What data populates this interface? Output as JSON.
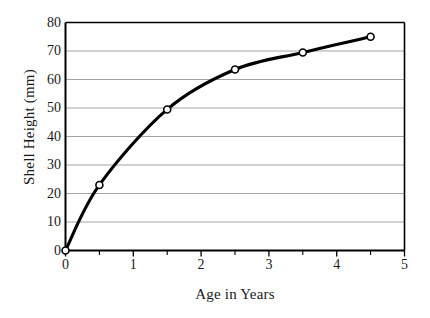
{
  "chart_data": {
    "type": "line",
    "title": "",
    "xlabel": "Age in Years",
    "ylabel": "Shell Height (mm)",
    "x": [
      0,
      0.5,
      1.5,
      2.5,
      3.5,
      4.5
    ],
    "values": [
      0,
      23,
      49.5,
      63.5,
      69.5,
      75
    ],
    "series": [
      {
        "name": "Shell Height",
        "x": [
          0,
          0.5,
          1.5,
          2.5,
          3.5,
          4.5
        ],
        "values": [
          0,
          23,
          49.5,
          63.5,
          69.5,
          75
        ]
      }
    ],
    "xlim": [
      0,
      5
    ],
    "ylim": [
      0,
      80
    ],
    "xticks": [
      0,
      1,
      2,
      3,
      4,
      5
    ],
    "xtick_labels": [
      "0",
      "1",
      "2",
      "3",
      "4",
      "5"
    ],
    "xminor_step": 0.5,
    "yticks": [
      0,
      10,
      20,
      30,
      40,
      50,
      60,
      70,
      80
    ],
    "ytick_labels": [
      "0",
      "10",
      "20",
      "30",
      "40",
      "50",
      "60",
      "70",
      "80"
    ],
    "grid": "horizontal",
    "legend": "none",
    "marker": "open-circle",
    "line_color": "#000000",
    "grid_color": "#9a9a9a",
    "axis_color": "#000000",
    "marker_fill": "#ffffff",
    "background": "#ffffff",
    "annotations": []
  }
}
